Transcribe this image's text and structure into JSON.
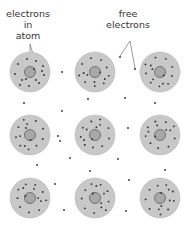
{
  "labels": {
    "atom_electrons": [
      "electrons in",
      "atom"
    ],
    "free_electrons": [
      "free",
      "electrons"
    ]
  },
  "colors": {
    "atom_fill": "#c8c8c8",
    "atom_edge": "#b0b0b0",
    "nucleus_fill": "#a8a8a8",
    "nucleus_edge": "#6a6a6a",
    "electron": "#2a2a2a",
    "pointer_line": "#555555"
  },
  "atoms": {
    "rows": 3,
    "cols": 3,
    "centers_x": [
      30,
      95,
      160
    ],
    "centers_y": [
      72,
      135,
      198
    ],
    "radius": 20,
    "nucleus_radius": 5.5
  },
  "free_electron_positions": [
    [
      62,
      72
    ],
    [
      120,
      57
    ],
    [
      135,
      69
    ],
    [
      88,
      99
    ],
    [
      125,
      98
    ],
    [
      24,
      103
    ],
    [
      62,
      111
    ],
    [
      155,
      103
    ],
    [
      58,
      136
    ],
    [
      128,
      128
    ],
    [
      70,
      158
    ],
    [
      118,
      159
    ],
    [
      37,
      165
    ],
    [
      90,
      171
    ],
    [
      165,
      170
    ],
    [
      55,
      184
    ],
    [
      129,
      180
    ],
    [
      64,
      210
    ],
    [
      126,
      211
    ],
    [
      60,
      141
    ]
  ]
}
